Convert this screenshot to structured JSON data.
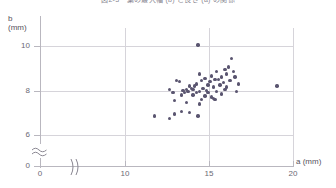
{
  "figure": {
    "title_clipped": "図2-3　葉の最大幅 (b) と長さ (a) の関係",
    "point_color": "#5a5570",
    "grid_color": "#d6d4da",
    "axis_color": "#b9b7bf"
  },
  "axes": {
    "y": {
      "label": "b",
      "unit": "(mm)",
      "ticks": [
        "10",
        "8",
        "6",
        "0"
      ],
      "break_symbol": "≈"
    },
    "x": {
      "label": "a",
      "unit": "(mm)",
      "ticks": [
        "0",
        "10",
        "15",
        "20"
      ],
      "break_symbol": ")("
    }
  },
  "chart_data": {
    "type": "scatter",
    "title": "図2-3　葉の最大幅 (b) と長さ (a) の関係",
    "xlabel": "a (mm)",
    "ylabel": "b (mm)",
    "xlim": [
      0,
      20
    ],
    "ylim": [
      0,
      10.6
    ],
    "xticks": [
      0,
      10,
      15,
      20
    ],
    "yticks": [
      0,
      6,
      8,
      10
    ],
    "grid": true,
    "axis_break_x": true,
    "axis_break_y": true,
    "legend": null,
    "n_points": 62,
    "points": [
      [
        14.35,
        10.05
      ],
      [
        16.35,
        9.45
      ],
      [
        16.15,
        9.05
      ],
      [
        15.95,
        8.95
      ],
      [
        16.45,
        8.85
      ],
      [
        15.45,
        8.85
      ],
      [
        14.45,
        8.75
      ],
      [
        16.05,
        8.75
      ],
      [
        15.15,
        8.65
      ],
      [
        15.75,
        8.6
      ],
      [
        16.55,
        8.6
      ],
      [
        14.75,
        8.55
      ],
      [
        15.35,
        8.5
      ],
      [
        15.55,
        8.5
      ],
      [
        16.25,
        8.45
      ],
      [
        14.55,
        8.45
      ],
      [
        13.05,
        8.45
      ],
      [
        13.25,
        8.4
      ],
      [
        15.05,
        8.4
      ],
      [
        15.85,
        8.35
      ],
      [
        16.75,
        8.3
      ],
      [
        14.25,
        8.3
      ],
      [
        14.95,
        8.25
      ],
      [
        15.65,
        8.25
      ],
      [
        19.05,
        8.2
      ],
      [
        14.15,
        8.2
      ],
      [
        13.85,
        8.2
      ],
      [
        15.25,
        8.15
      ],
      [
        16.05,
        8.15
      ],
      [
        14.65,
        8.1
      ],
      [
        13.95,
        8.1
      ],
      [
        14.05,
        8.05
      ],
      [
        15.95,
        8.05
      ],
      [
        12.65,
        8.05
      ],
      [
        13.65,
        8.05
      ],
      [
        14.85,
        8.0
      ],
      [
        13.45,
        8.0
      ],
      [
        16.65,
        7.95
      ],
      [
        14.45,
        7.95
      ],
      [
        13.75,
        7.95
      ],
      [
        15.45,
        7.95
      ],
      [
        14.25,
        7.9
      ],
      [
        13.55,
        7.9
      ],
      [
        12.85,
        7.9
      ],
      [
        14.95,
        7.9
      ],
      [
        15.75,
        7.85
      ],
      [
        14.05,
        7.8
      ],
      [
        13.35,
        7.8
      ],
      [
        14.75,
        7.75
      ],
      [
        15.15,
        7.7
      ],
      [
        15.25,
        7.65
      ],
      [
        15.35,
        7.6
      ],
      [
        14.55,
        7.6
      ],
      [
        12.95,
        7.55
      ],
      [
        13.65,
        7.45
      ],
      [
        14.45,
        7.4
      ],
      [
        13.35,
        7.05
      ],
      [
        13.85,
        7.0
      ],
      [
        12.95,
        6.95
      ],
      [
        11.75,
        6.85
      ],
      [
        14.35,
        6.85
      ],
      [
        12.65,
        6.75
      ]
    ]
  }
}
